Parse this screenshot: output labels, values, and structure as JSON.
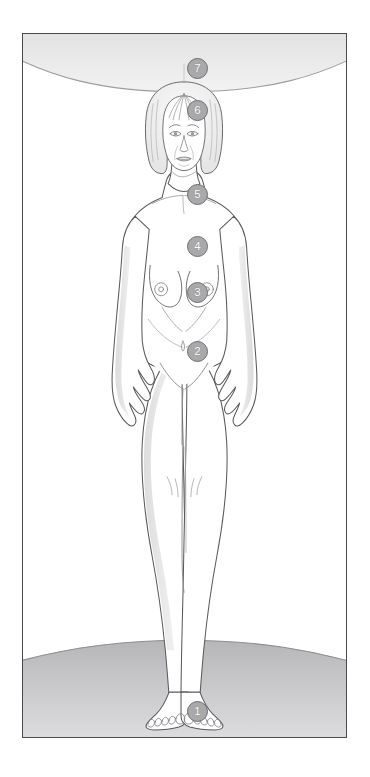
{
  "diagram": {
    "frame": {
      "border_color": "#4a4a4d",
      "background_color": "#ffffff"
    },
    "palette": {
      "outline": "#5a5a5c",
      "badge_fill": "#a9a9ab",
      "badge_border": "#6e6e70",
      "badge_text": "#ffffff",
      "shade_light": "#ededee",
      "shade_mid": "#d9d9da",
      "shade_dark": "#b9b9bb",
      "skin": "#ffffff"
    },
    "scene": {
      "ceiling_arc_label": "upper arc glow",
      "ground_arc_label": "lower ground ellipse"
    },
    "markers": [
      {
        "number": "1",
        "name": "marker-1-feet",
        "x": 186,
        "y": 711,
        "region": "feet / below feet"
      },
      {
        "number": "2",
        "name": "marker-2-lower-abdomen",
        "x": 186,
        "y": 351,
        "region": "lower abdomen"
      },
      {
        "number": "3",
        "name": "marker-3-solar-plexus",
        "x": 186,
        "y": 292,
        "region": "solar plexus"
      },
      {
        "number": "4",
        "name": "marker-4-chest",
        "x": 186,
        "y": 246,
        "region": "chest / heart"
      },
      {
        "number": "5",
        "name": "marker-5-throat",
        "x": 186,
        "y": 194,
        "region": "throat"
      },
      {
        "number": "6",
        "name": "marker-6-forehead",
        "x": 186,
        "y": 110,
        "region": "forehead / brow"
      },
      {
        "number": "7",
        "name": "marker-7-crown",
        "x": 186,
        "y": 68,
        "region": "crown / above head"
      }
    ]
  }
}
